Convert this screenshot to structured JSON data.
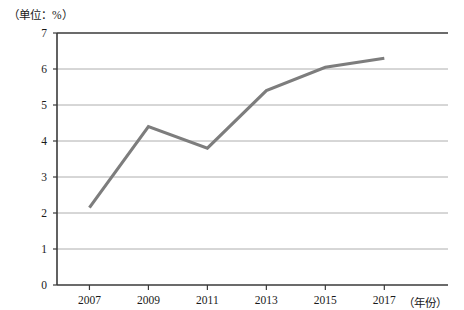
{
  "chart_data": {
    "type": "line",
    "title": "",
    "unit_label": "（单位：%）",
    "xlabel": "（年份）",
    "ylabel": "",
    "categories": [
      "2007",
      "2009",
      "2011",
      "2013",
      "2015",
      "2017"
    ],
    "x": [
      2007,
      2009,
      2011,
      2013,
      2015,
      2017
    ],
    "values": [
      2.15,
      4.4,
      3.8,
      5.4,
      6.05,
      6.3
    ],
    "series": [
      {
        "name": "",
        "values": [
          2.15,
          4.4,
          3.8,
          5.4,
          6.05,
          6.3
        ],
        "color": "#7d7d7d"
      }
    ],
    "y_ticks": [
      "0",
      "1",
      "2",
      "3",
      "4",
      "5",
      "6",
      "7"
    ],
    "y_tick_values": [
      0,
      1,
      2,
      3,
      4,
      5,
      6,
      7
    ],
    "ylim": [
      0,
      7
    ],
    "xlim": [
      2006.5,
      2017.5
    ],
    "grid": "horizontal",
    "legend": "none",
    "line_color": "#7d7d7d",
    "grid_color": "#9a9a9a",
    "axis_color": "#3a3a3a"
  },
  "axes": {
    "unit_caption": "（单位：%）",
    "x_axis_caption": "（年份）"
  }
}
